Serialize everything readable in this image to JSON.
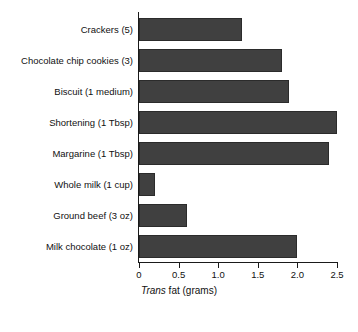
{
  "chart_data": {
    "type": "bar",
    "orientation": "horizontal",
    "title": "",
    "subtitle": "",
    "xlabel_prefix_italic": "Trans",
    "xlabel_rest": " fat (grams)",
    "xlabel": "Trans fat (grams)",
    "ylabel": "",
    "categories": [
      "Crackers (5)",
      "Chocolate chip cookies (3)",
      "Biscuit (1 medium)",
      "Shortening (1 Tbsp)",
      "Margarine (1 Tbsp)",
      "Whole milk (1 cup)",
      "Ground beef (3 oz)",
      "Milk chocolate (1 oz)"
    ],
    "values": [
      1.3,
      1.8,
      1.9,
      2.5,
      2.4,
      0.2,
      0.6,
      2.0
    ],
    "xlim": [
      0,
      2.5
    ],
    "xticks": [
      0,
      0.5,
      1.0,
      1.5,
      2.0,
      2.5
    ],
    "xtick_labels": [
      "0",
      "0.5",
      "1.0",
      "1.5",
      "2.0",
      "2.5"
    ],
    "grid": false,
    "legend": false,
    "bar_color": "#404040",
    "bar_edge_color": "#2b2b2b",
    "axis_color": "#1a1a1a",
    "background": "#ffffff"
  }
}
